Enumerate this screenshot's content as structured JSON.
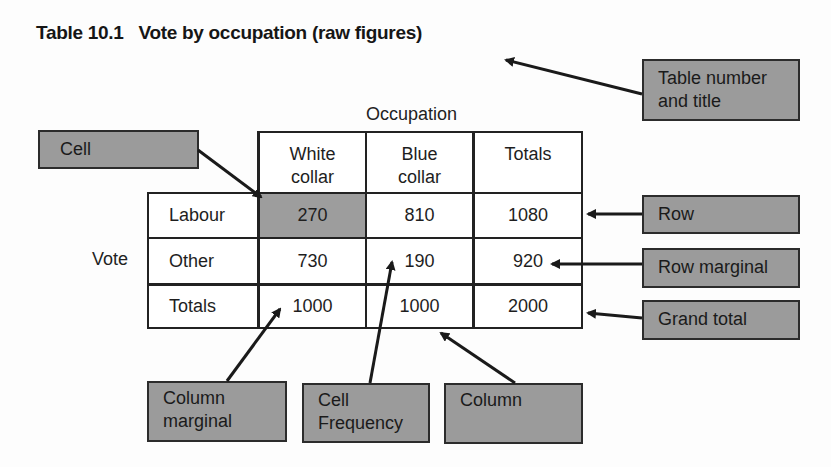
{
  "title": {
    "number": "Table 10.1",
    "text": "Vote by occupation (raw figures)"
  },
  "table": {
    "column_variable": "Occupation",
    "row_variable": "Vote",
    "columns": [
      "White collar",
      "Blue collar",
      "Totals"
    ],
    "column_lines": [
      [
        "White",
        "collar"
      ],
      [
        "Blue",
        "collar"
      ],
      [
        "Totals"
      ]
    ],
    "rows": [
      {
        "label": "Labour",
        "values": [
          "270",
          "810",
          "1080"
        ]
      },
      {
        "label": "Other",
        "values": [
          "730",
          "190",
          "920"
        ]
      },
      {
        "label": "Totals",
        "values": [
          "1000",
          "1000",
          "2000"
        ]
      }
    ],
    "highlighted_cell": {
      "row": "Labour",
      "column": "White collar"
    },
    "highlight_color": "#9d9d9d"
  },
  "annotations": {
    "table_title": {
      "line1": "Table number",
      "line2": "and title"
    },
    "cell": {
      "line1": "Cell"
    },
    "row": {
      "line1": "Row"
    },
    "row_marginal": {
      "line1": "Row marginal"
    },
    "grand_total": {
      "line1": "Grand total"
    },
    "column_marginal": {
      "line1": "Column",
      "line2": "marginal"
    },
    "cell_frequency": {
      "line1": "Cell",
      "line2": "Frequency"
    },
    "column": {
      "line1": "Column"
    },
    "box_color": "#9b9b9b"
  }
}
